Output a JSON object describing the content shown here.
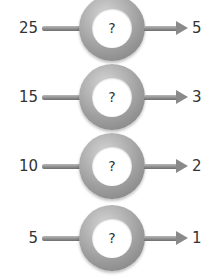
{
  "diagram": {
    "unknown_symbol": "?",
    "rows": [
      {
        "input": "25",
        "output": "5"
      },
      {
        "input": "15",
        "output": "3"
      },
      {
        "input": "10",
        "output": "2"
      },
      {
        "input": "5",
        "output": "1"
      }
    ]
  }
}
